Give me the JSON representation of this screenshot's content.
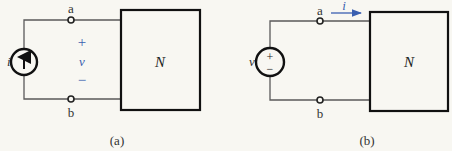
{
  "diagrams": [
    {
      "id": "a",
      "caption": "(a)",
      "network_label": "N",
      "source": {
        "type": "current-source",
        "label": "i",
        "direction": "up"
      },
      "terminals": {
        "top": "a",
        "bottom": "b"
      },
      "polarity": {
        "plus": "+",
        "variable": "v",
        "minus": "−"
      }
    },
    {
      "id": "b",
      "caption": "(b)",
      "network_label": "N",
      "source": {
        "type": "voltage-source",
        "label": "v",
        "plus": "+",
        "minus": "−"
      },
      "terminals": {
        "top": "a",
        "bottom": "b"
      },
      "current_arrow": {
        "label": "i",
        "direction": "right"
      }
    }
  ],
  "colors": {
    "annotation": "#3a5fb0",
    "line": "#111111",
    "background": "#f8f7f2"
  }
}
